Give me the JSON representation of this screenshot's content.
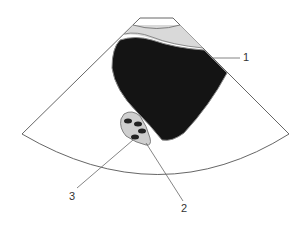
{
  "figure": {
    "type": "ultrasound-schematic",
    "labels": [
      {
        "id": "1",
        "text": "1",
        "x": 243,
        "y": 52
      },
      {
        "id": "2",
        "text": "2",
        "x": 181,
        "y": 203
      },
      {
        "id": "3",
        "text": "3",
        "x": 69,
        "y": 191
      }
    ],
    "colors": {
      "outline": "#555555",
      "fan_fill": "#ffffff",
      "near_field_band": "#d9d9d9",
      "anechoic_mass": "#141414",
      "small_structure": "#cfcfcf",
      "dots": "#222222",
      "leader": "#666666"
    }
  }
}
